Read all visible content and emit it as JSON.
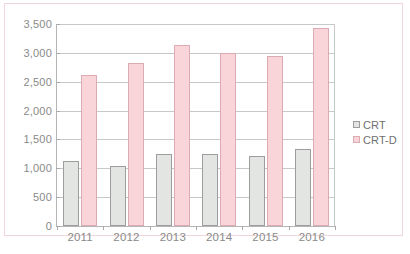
{
  "chart_data": {
    "type": "bar",
    "title": "",
    "xlabel": "",
    "ylabel": "",
    "categories": [
      "2011",
      "2012",
      "2013",
      "2014",
      "2015",
      "2016"
    ],
    "series": [
      {
        "name": "CRT",
        "color": "#e3e5e3",
        "border": "#9d9d9d",
        "values": [
          1120,
          1040,
          1250,
          1250,
          1210,
          1340
        ]
      },
      {
        "name": "CRT-D",
        "color": "#f9d5da",
        "border": "#dcaab2",
        "values": [
          2610,
          2830,
          3140,
          3000,
          2950,
          3430
        ]
      }
    ],
    "ylim": [
      0,
      3500
    ],
    "ytick_values": [
      0,
      500,
      1000,
      1500,
      2000,
      2500,
      3000,
      3500
    ],
    "ytick_labels": [
      "0",
      "500",
      "1,000",
      "1,500",
      "2,000",
      "2,500",
      "3,000",
      "3,500"
    ],
    "grid": true,
    "legend_position": "right"
  },
  "legend": {
    "items": [
      {
        "label": "CRT"
      },
      {
        "label": "CRT-D"
      }
    ]
  },
  "caption": {
    "text": ""
  },
  "colors": {
    "frame_border": "#f0d8da",
    "gridline": "#c8c8c8",
    "axis": "#b5b5b5",
    "tick_text": "#8a8a8a",
    "crt_fill": "#e3e5e3",
    "crtd_fill": "#f9d5da"
  }
}
